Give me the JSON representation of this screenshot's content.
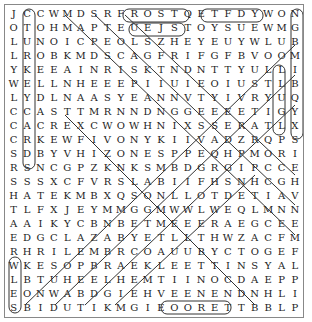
{
  "puzzle": {
    "type": "word-search",
    "rows": [
      "JCCWMDSRFROSTQETFDYWONSCC",
      "OTOHMAPTEUEJSTOYSUEWMGAAT",
      "LUNOICPEOLSZHEYEUYWLUBRAH",
      "LROBKMDSCAGFRIFGFBVOOMUM",
      "YKEEAINRISKTNDNTTYULLIMTE",
      "WELLNHEEEPIIUIEOIUSTLBRRR",
      "LYDLNAASYEANNVTYIVRYUQRER",
      "CCASTTMRNNDNGGEEEETIGYBIEY",
      "CACREXCWOWHNIXSSERATLXYHY",
      "CRKEWFIVONYKIIVADZRQPSNLMX",
      "SDBYVHIZONESPPEQHPMORIEWEA",
      "RSNCGPZKNKSMBDGRGIPCCECFHG",
      "SSSXCFVRSLABIIFHSNHCGHEEGQ",
      "HATEKMBXQSONLLOTDETIAVUNDL",
      "TLFXJEYMMGGMWWLWEQLMNNIRNT",
      "AAIKYCBNBETMEEERAEGCEEDRCL",
      "EDGCLAZABYETLLTHWZACFMYLCH",
      "RHRILEMBRCOAUUBYCTOGEFRAUEG",
      "WKESOPBRAEKLEETTINSYALONMS",
      "LBTUHEELHEMTIINOCDAEPPGSRU",
      "EONWABDGIEHVEENENDNHLILNTO",
      "SBIDUTIKMGIEOORETTBBLPPAIY",
      "NVWAREEOUTENTTILTCALKMMBNJ",
      "IBRILGRAAREORROUGSNJINZEOD",
      "TCFSEYLNPOHFHHYMNPAVPOWTN"
    ],
    "found_words_visible": [
      "FROST",
      "TOYS",
      "SNOW",
      "HYMN",
      "MERRY",
      "SLEDS",
      "CAROLS",
      "CHEER"
    ]
  }
}
